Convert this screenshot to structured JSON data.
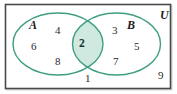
{
  "figure": {
    "type": "venn-diagram",
    "sets": 2,
    "universe_label": "U",
    "colors": {
      "curve_stroke": "#3f9e82",
      "intersection_fill": "#cfe9e0",
      "frame_stroke": "#4a4a4a",
      "text": "#1b1b1b",
      "background": "#ffffff"
    }
  },
  "labels": {
    "set_a": "A",
    "set_b": "B",
    "universe": "U"
  },
  "regions": {
    "a_only": [
      "4",
      "6",
      "8"
    ],
    "intersection": [
      "2"
    ],
    "b_only": [
      "3",
      "5",
      "7"
    ],
    "outside": [
      "1",
      "9"
    ]
  },
  "elements": {
    "a1": "4",
    "a2": "6",
    "a3": "8",
    "ab1": "2",
    "b1": "3",
    "b2": "5",
    "b3": "7",
    "u1": "1",
    "u2": "9"
  }
}
